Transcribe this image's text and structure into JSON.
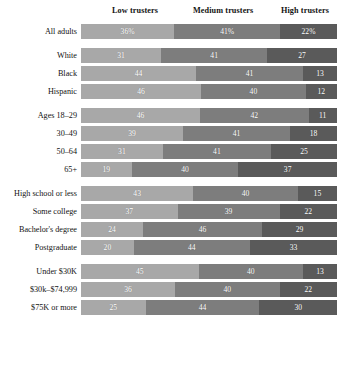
{
  "chart_data": {
    "type": "bar",
    "subtype": "stacked-horizontal-100",
    "title": "",
    "xlabel": "",
    "ylabel": "",
    "xlim": [
      0,
      100
    ],
    "grid": false,
    "legend_position": "top",
    "value_suffix_first_row_only": "%",
    "categories": [
      "All adults",
      "White",
      "Black",
      "Hispanic",
      "Ages 18–29",
      "30–49",
      "50–64",
      "65+",
      "High school or less",
      "Some college",
      "Bachelor's degree",
      "Postgraduate",
      "Under $30K",
      "$30k–$74,999",
      "$75K or more"
    ],
    "series": [
      {
        "name": "Low trusters",
        "color": "#a8a8a8",
        "values": [
          36,
          31,
          44,
          46,
          46,
          39,
          31,
          19,
          43,
          37,
          24,
          20,
          45,
          36,
          25
        ]
      },
      {
        "name": "Medium trusters",
        "color": "#7d7d7d",
        "values": [
          41,
          41,
          41,
          40,
          42,
          41,
          41,
          40,
          40,
          39,
          46,
          44,
          40,
          40,
          44
        ]
      },
      {
        "name": "High trusters",
        "color": "#5a5a5a",
        "values": [
          22,
          27,
          13,
          12,
          11,
          18,
          25,
          37,
          15,
          22,
          29,
          33,
          13,
          22,
          30
        ]
      }
    ]
  },
  "header": {
    "columns": [
      {
        "label": "Low trusters"
      },
      {
        "label": "Medium trusters"
      },
      {
        "label": "High trusters"
      }
    ]
  },
  "groups": [
    {
      "name": "all-adults",
      "rows": [
        {
          "label": "All adults",
          "segments": [
            {
              "name": "low",
              "value": "36%",
              "pct": 36
            },
            {
              "name": "medium",
              "value": "41%",
              "pct": 41
            },
            {
              "name": "high",
              "value": "22%",
              "pct": 22
            }
          ]
        }
      ]
    },
    {
      "name": "race",
      "rows": [
        {
          "label": "White",
          "segments": [
            {
              "name": "low",
              "value": "31",
              "pct": 31
            },
            {
              "name": "medium",
              "value": "41",
              "pct": 41
            },
            {
              "name": "high",
              "value": "27",
              "pct": 27
            }
          ]
        },
        {
          "label": "Black",
          "segments": [
            {
              "name": "low",
              "value": "44",
              "pct": 44
            },
            {
              "name": "medium",
              "value": "41",
              "pct": 41
            },
            {
              "name": "high",
              "value": "13",
              "pct": 13
            }
          ]
        },
        {
          "label": "Hispanic",
          "segments": [
            {
              "name": "low",
              "value": "46",
              "pct": 46
            },
            {
              "name": "medium",
              "value": "40",
              "pct": 40
            },
            {
              "name": "high",
              "value": "12",
              "pct": 12
            }
          ]
        }
      ]
    },
    {
      "name": "age",
      "rows": [
        {
          "label": "Ages 18–29",
          "segments": [
            {
              "name": "low",
              "value": "46",
              "pct": 46
            },
            {
              "name": "medium",
              "value": "42",
              "pct": 42
            },
            {
              "name": "high",
              "value": "11",
              "pct": 11
            }
          ]
        },
        {
          "label": "30–49",
          "segments": [
            {
              "name": "low",
              "value": "39",
              "pct": 39
            },
            {
              "name": "medium",
              "value": "41",
              "pct": 41
            },
            {
              "name": "high",
              "value": "18",
              "pct": 18
            }
          ]
        },
        {
          "label": "50–64",
          "segments": [
            {
              "name": "low",
              "value": "31",
              "pct": 31
            },
            {
              "name": "medium",
              "value": "41",
              "pct": 41
            },
            {
              "name": "high",
              "value": "25",
              "pct": 25
            }
          ]
        },
        {
          "label": "65+",
          "segments": [
            {
              "name": "low",
              "value": "19",
              "pct": 19
            },
            {
              "name": "medium",
              "value": "40",
              "pct": 40
            },
            {
              "name": "high",
              "value": "37",
              "pct": 37
            }
          ]
        }
      ]
    },
    {
      "name": "education",
      "rows": [
        {
          "label": "High school or less",
          "segments": [
            {
              "name": "low",
              "value": "43",
              "pct": 43
            },
            {
              "name": "medium",
              "value": "40",
              "pct": 40
            },
            {
              "name": "high",
              "value": "15",
              "pct": 15
            }
          ]
        },
        {
          "label": "Some college",
          "segments": [
            {
              "name": "low",
              "value": "37",
              "pct": 37
            },
            {
              "name": "medium",
              "value": "39",
              "pct": 39
            },
            {
              "name": "high",
              "value": "22",
              "pct": 22
            }
          ]
        },
        {
          "label": "Bachelor's degree",
          "segments": [
            {
              "name": "low",
              "value": "24",
              "pct": 24
            },
            {
              "name": "medium",
              "value": "46",
              "pct": 46
            },
            {
              "name": "high",
              "value": "29",
              "pct": 29
            }
          ]
        },
        {
          "label": "Postgraduate",
          "segments": [
            {
              "name": "low",
              "value": "20",
              "pct": 20
            },
            {
              "name": "medium",
              "value": "44",
              "pct": 44
            },
            {
              "name": "high",
              "value": "33",
              "pct": 33
            }
          ]
        }
      ]
    },
    {
      "name": "income",
      "rows": [
        {
          "label": "Under $30K",
          "segments": [
            {
              "name": "low",
              "value": "45",
              "pct": 45
            },
            {
              "name": "medium",
              "value": "40",
              "pct": 40
            },
            {
              "name": "high",
              "value": "13",
              "pct": 13
            }
          ]
        },
        {
          "label": "$30k–$74,999",
          "segments": [
            {
              "name": "low",
              "value": "36",
              "pct": 36
            },
            {
              "name": "medium",
              "value": "40",
              "pct": 40
            },
            {
              "name": "high",
              "value": "22",
              "pct": 22
            }
          ]
        },
        {
          "label": "$75K or more",
          "segments": [
            {
              "name": "low",
              "value": "25",
              "pct": 25
            },
            {
              "name": "medium",
              "value": "44",
              "pct": 44
            },
            {
              "name": "high",
              "value": "30",
              "pct": 30
            }
          ]
        }
      ]
    }
  ],
  "colors": {
    "low": "#a8a8a8",
    "medium": "#7d7d7d",
    "high": "#5a5a5a",
    "text": "#131313",
    "background": "#ffffff"
  }
}
